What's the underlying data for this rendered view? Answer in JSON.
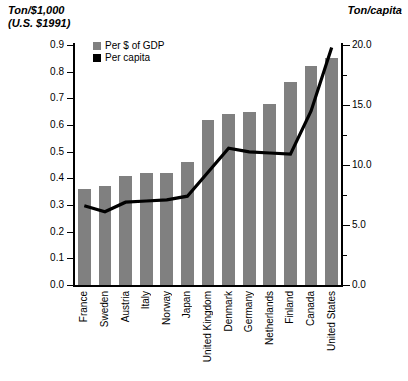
{
  "axes": {
    "left_title": "Ton/$1,000\n(U.S. $1991)",
    "left_title_line1": "Ton/$1,000",
    "left_title_line2": "(U.S. $1991)",
    "right_title": "Ton/capita"
  },
  "legend": {
    "items": [
      {
        "label": "Per $ of GDP",
        "color": "#808080",
        "type": "bar"
      },
      {
        "label": "Per capita",
        "color": "#000000",
        "type": "line"
      }
    ]
  },
  "colors": {
    "bar": "#808080",
    "line": "#000000",
    "axis": "#000000",
    "background": "#ffffff"
  },
  "chart_data": {
    "type": "bar",
    "title": "",
    "subtitle": "",
    "xlabel": "",
    "ylabel": "Ton/$1,000 (U.S. $1991)",
    "y2label": "Ton/capita",
    "grid": false,
    "legend_position": "top-left-inside",
    "ylim": [
      0.0,
      0.9
    ],
    "y2lim": [
      0.0,
      20.0
    ],
    "yticks": [
      0.0,
      0.1,
      0.2,
      0.3,
      0.4,
      0.5,
      0.6,
      0.7,
      0.8,
      0.9
    ],
    "ytick_labels": [
      "0.0",
      "0.1",
      "0.2",
      "0.3",
      "0.4",
      "0.5",
      "0.6",
      "0.7",
      "0.8",
      "0.9"
    ],
    "y2ticks": [
      0.0,
      5.0,
      10.0,
      15.0,
      20.0
    ],
    "y2tick_labels": [
      "0.0",
      "5.0",
      "10.0",
      "15.0",
      "20.0"
    ],
    "categories": [
      "France",
      "Sweden",
      "Austria",
      "Italy",
      "Norway",
      "Japan",
      "United Kingdom",
      "Denmark",
      "Germany",
      "Netherlands",
      "Finland",
      "Canada",
      "United States"
    ],
    "series": [
      {
        "name": "Per $ of GDP",
        "type": "bar",
        "axis": "left",
        "color": "#808080",
        "values": [
          0.36,
          0.37,
          0.41,
          0.42,
          0.42,
          0.46,
          0.62,
          0.64,
          0.65,
          0.68,
          0.76,
          0.82,
          0.85
        ]
      },
      {
        "name": "Per capita",
        "type": "line",
        "axis": "right",
        "color": "#000000",
        "values": [
          6.6,
          6.1,
          6.9,
          7.0,
          7.1,
          7.4,
          9.4,
          11.4,
          11.1,
          11.0,
          10.9,
          14.5,
          19.8
        ]
      }
    ]
  }
}
